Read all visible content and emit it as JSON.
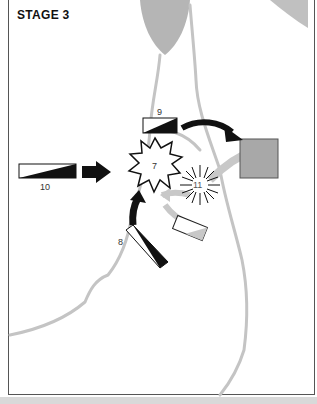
{
  "title": "STAGE 3",
  "colors": {
    "terrain": "#b5b5b5",
    "river_lines": "#c4c4c4",
    "objective_fill": "#a8a8a8",
    "unit_black": "#111111",
    "frame": "#555555"
  },
  "units": [
    {
      "id": "9",
      "label": "9",
      "type": "unit-wedge"
    },
    {
      "id": "10",
      "label": "10",
      "type": "unit-wedge"
    },
    {
      "id": "8",
      "label": "8",
      "type": "unit-wedge"
    }
  ],
  "markers": [
    {
      "id": "7",
      "label": "7",
      "type": "explosion"
    },
    {
      "id": "11",
      "label": "11",
      "type": "burst"
    }
  ],
  "features": [
    "grey-objective-square",
    "enemy-unit-rectangle",
    "black-attack-arrows",
    "grey-retreat-arrows",
    "river-lines"
  ]
}
